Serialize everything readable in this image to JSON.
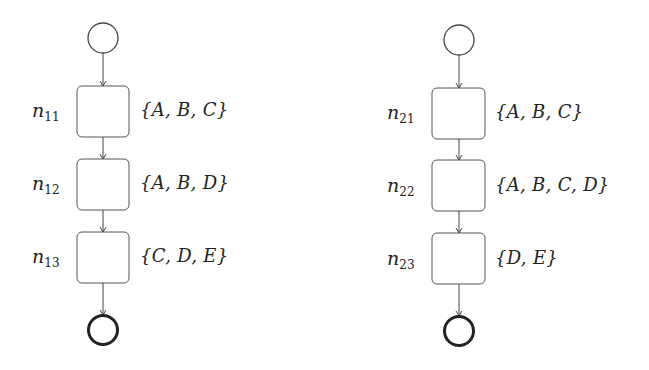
{
  "diagram": {
    "type": "process-flow",
    "colors": {
      "stroke": "#444444",
      "background": "#ffffff",
      "text": "#222222"
    },
    "flows": [
      {
        "id": "flow-1",
        "start": {
          "shape": "circle",
          "style": "thin"
        },
        "nodes": [
          {
            "name": "n",
            "sub": "11",
            "set": "{A, B, C}"
          },
          {
            "name": "n",
            "sub": "12",
            "set": "{A, B, D}"
          },
          {
            "name": "n",
            "sub": "13",
            "set": "{C, D, E}"
          }
        ],
        "end": {
          "shape": "circle",
          "style": "thick"
        }
      },
      {
        "id": "flow-2",
        "start": {
          "shape": "circle",
          "style": "thin"
        },
        "nodes": [
          {
            "name": "n",
            "sub": "21",
            "set": "{A, B, C}"
          },
          {
            "name": "n",
            "sub": "22",
            "set": "{A, B, C, D}"
          },
          {
            "name": "n",
            "sub": "23",
            "set": "{D, E}"
          }
        ],
        "end": {
          "shape": "circle",
          "style": "thick"
        }
      }
    ]
  }
}
